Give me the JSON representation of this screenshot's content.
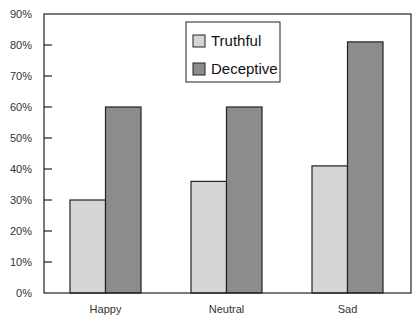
{
  "chart_data": {
    "type": "bar",
    "title": "",
    "xlabel": "",
    "ylabel": "",
    "categories": [
      "Happy",
      "Neutral",
      "Sad"
    ],
    "series": [
      {
        "name": "Truthful",
        "values": [
          30,
          36,
          41
        ],
        "color": "#d6d6d6"
      },
      {
        "name": "Deceptive",
        "values": [
          60,
          60,
          81
        ],
        "color": "#8c8c8c"
      }
    ],
    "ylim": [
      0,
      90
    ],
    "yticks": [
      0,
      10,
      20,
      30,
      40,
      50,
      60,
      70,
      80,
      90
    ],
    "ytick_labels": [
      "0%",
      "10%",
      "20%",
      "30%",
      "40%",
      "50%",
      "60%",
      "70%",
      "80%",
      "90%"
    ],
    "grid": false,
    "legend_position": "top-center-inside"
  },
  "legend": {
    "items": [
      {
        "label": "Truthful",
        "color": "#d6d6d6"
      },
      {
        "label": "Deceptive",
        "color": "#8c8c8c"
      }
    ]
  }
}
